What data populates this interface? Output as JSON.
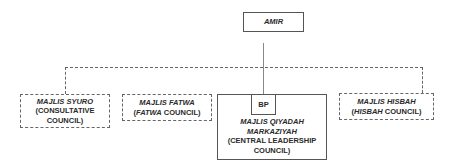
{
  "diagram": {
    "type": "org-chart",
    "top": {
      "label": "AMIR"
    },
    "children": [
      {
        "id": "syuro",
        "line1_italic": "MAJLIS SYURO",
        "line2": "(CONSULTATIVE",
        "line3": "COUNCIL)",
        "border": "dashed"
      },
      {
        "id": "fatwa",
        "line1_italic": "MAJLIS FATWA",
        "line2_open": "(",
        "line2_italic": "FATWA",
        "line2_rest": " COUNCIL)",
        "border": "dashed"
      },
      {
        "id": "qiyadah",
        "badge": "BP",
        "line1_italic": "MAJLIS QIYADAH",
        "line2_italic": "MARKAZIYAH",
        "line3": "(CENTRAL LEADERSHIP",
        "line4": "COUNCIL)",
        "border": "solid"
      },
      {
        "id": "hisbah",
        "line1_italic": "MAJLIS HISBAH",
        "line2_open": "(",
        "line2_italic": "HISBAH",
        "line2_rest": " COUNCIL)",
        "border": "dashed"
      }
    ],
    "edges": [
      {
        "from": "AMIR",
        "to": "qiyadah",
        "style": "solid"
      },
      {
        "from": "AMIR",
        "to": "syuro",
        "style": "dashed"
      },
      {
        "from": "AMIR",
        "to": "fatwa",
        "style": "dashed"
      },
      {
        "from": "AMIR",
        "to": "hisbah",
        "style": "dashed"
      }
    ]
  }
}
